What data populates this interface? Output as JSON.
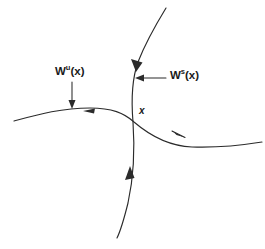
{
  "diagram": {
    "background_color": "#ffffff",
    "stroke_color": "#2b2b2b",
    "labels": {
      "unstable_manifold": {
        "base": "W",
        "superscript": "u",
        "argument": "(x)",
        "full_text": "Wu(x)"
      },
      "stable_manifold": {
        "base": "W",
        "superscript": "s",
        "argument": "(x)",
        "full_text": "Ws(x)"
      },
      "fixed_point": "x"
    },
    "curves": [
      {
        "name": "unstable-manifold-curve",
        "orientation": "horizontal",
        "flow_direction_left_branch": "inward-toward-left-arrowhead",
        "flow_direction_right_branch": "outward-to-right"
      },
      {
        "name": "stable-manifold-curve",
        "orientation": "vertical",
        "flow_direction_upper_branch": "downward-toward-point",
        "flow_direction_lower_branch": "upward-toward-point"
      }
    ],
    "arrows": [
      {
        "name": "flow-arrow-unstable-left",
        "direction": "left"
      },
      {
        "name": "flow-arrow-unstable-right",
        "direction": "right"
      },
      {
        "name": "flow-arrow-stable-upper",
        "direction": "down"
      },
      {
        "name": "flow-arrow-stable-lower",
        "direction": "up"
      },
      {
        "name": "pointer-arrow-unstable-label",
        "direction": "down"
      },
      {
        "name": "pointer-arrow-stable-label",
        "direction": "left"
      }
    ]
  }
}
